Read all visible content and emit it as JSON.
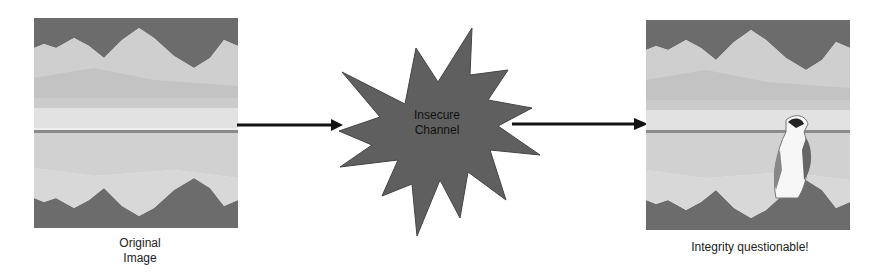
{
  "diagram": {
    "left_image": {
      "caption_line1": "Original",
      "caption_line2": "Image",
      "description": "mountain lake with reflection"
    },
    "channel": {
      "line1": "Insecure",
      "line2": "Channel",
      "fill": "#5f5f5f"
    },
    "right_image": {
      "caption": "Integrity questionable!",
      "description": "mountain lake with reflection and an inserted penguin"
    },
    "arrows": [
      {
        "from": "left_image",
        "to": "channel"
      },
      {
        "from": "channel",
        "to": "right_image"
      }
    ]
  }
}
